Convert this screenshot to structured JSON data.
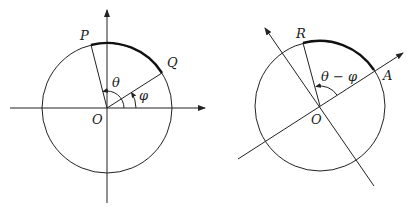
{
  "figures": [
    {
      "id": "left",
      "labels": {
        "P": "P",
        "Q": "Q",
        "O": "O",
        "theta": "θ",
        "phi": "φ"
      },
      "description": "Unit circle with x and y axes; points P and Q on circle; angle θ from x-axis to OP, angle φ from x-axis to OQ; arc PQ highlighted"
    },
    {
      "id": "right",
      "labels": {
        "R": "R",
        "A": "A",
        "O": "O",
        "angle": "θ − φ"
      },
      "description": "Same circle with rotated axes so OA lies along new x-axis; point R on circle; angle θ − φ from OA to OR; arc RA highlighted"
    }
  ],
  "colors": {
    "stroke": "#222222",
    "background": "#ffffff"
  }
}
